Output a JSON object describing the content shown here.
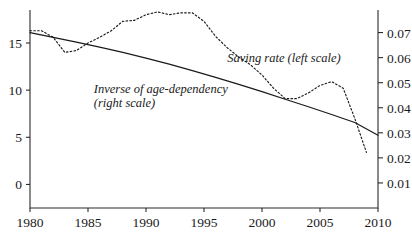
{
  "chart_data": {
    "type": "line",
    "title": "",
    "subtitle": "",
    "xlabel": "",
    "ylabel": "",
    "grid": false,
    "legend_position": "inline-annotations",
    "xlim": [
      1980,
      2010
    ],
    "x_ticks": [
      "1980",
      "1985",
      "1990",
      "1995",
      "2000",
      "2005",
      "2010"
    ],
    "x_tick_values": [
      1980,
      1985,
      1990,
      1995,
      2000,
      2005,
      2010
    ],
    "left_axis": {
      "label": "",
      "ylim": [
        -2.5,
        18.5
      ],
      "ticks": [
        "0",
        "5",
        "10",
        "15"
      ],
      "tick_values": [
        0,
        5,
        10,
        15
      ]
    },
    "right_axis": {
      "label": "",
      "ylim": [
        0.0,
        0.079
      ],
      "ticks": [
        "0.01",
        "0.02",
        "0.03",
        "0.04",
        "0.05",
        "0.06",
        "0.07"
      ],
      "tick_values": [
        0.01,
        0.02,
        0.03,
        0.04,
        0.05,
        0.06,
        0.07
      ]
    },
    "series": [
      {
        "name": "Saving rate (left scale)",
        "axis": "left",
        "style": "dotted",
        "color": "#1a1a1a",
        "x": [
          1980,
          1981,
          1982,
          1983,
          1984,
          1985,
          1986,
          1987,
          1988,
          1989,
          1990,
          1991,
          1992,
          1993,
          1994,
          1995,
          1996,
          1997,
          1998,
          1999,
          2000,
          2001,
          2002,
          2003,
          2004,
          2005,
          2006,
          2007,
          2008,
          2009
        ],
        "values": [
          16.3,
          16.3,
          15.6,
          14.0,
          14.2,
          15.0,
          15.6,
          16.3,
          17.3,
          17.4,
          18.0,
          18.3,
          18.0,
          18.2,
          18.2,
          17.3,
          15.7,
          14.5,
          13.5,
          12.7,
          11.6,
          10.2,
          9.1,
          9.1,
          9.7,
          10.5,
          10.9,
          10.2,
          7.0,
          3.4
        ]
      },
      {
        "name": "Inverse of age-dependency (right scale)",
        "axis": "right",
        "style": "solid",
        "color": "#1a1a1a",
        "x": [
          1980,
          1982,
          1984,
          1986,
          1988,
          1990,
          1992,
          1994,
          1996,
          1998,
          2000,
          2002,
          2004,
          2006,
          2008,
          2010
        ],
        "values": [
          0.07,
          0.0681,
          0.0662,
          0.0642,
          0.0621,
          0.0598,
          0.0574,
          0.0548,
          0.0521,
          0.0493,
          0.0464,
          0.0434,
          0.0404,
          0.0373,
          0.0341,
          0.029
        ]
      }
    ],
    "annotations": [
      {
        "name": "saving-rate-annotation",
        "lines": [
          "Saving rate (left scale)"
        ],
        "x": 1997.0,
        "y_px": 62
      },
      {
        "name": "age-dependency-annotation",
        "lines": [
          "Inverse of age-dependency",
          "(right scale)"
        ],
        "x": 1985.5,
        "y_px": 93
      }
    ]
  }
}
